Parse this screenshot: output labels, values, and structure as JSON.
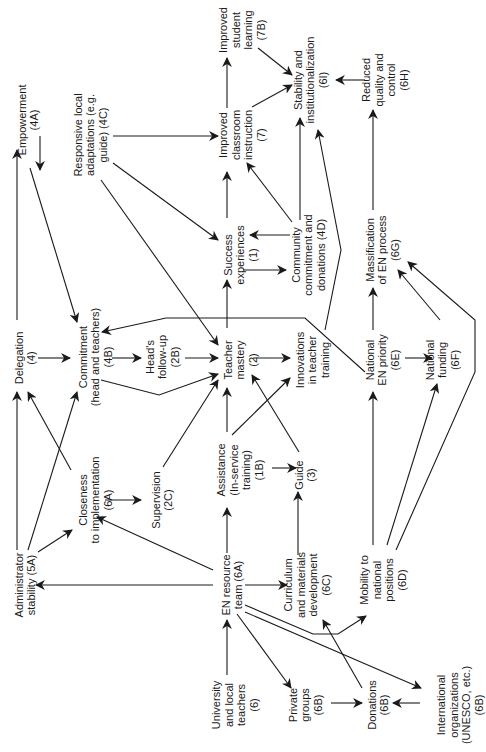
{
  "figure": {
    "orientation": "rotated-90-ccw",
    "line_color": "#1a1a1a",
    "background": "#ffffff"
  },
  "nodes": [
    {
      "id": "4A",
      "lines": [
        "Empowerment",
        "(4A)"
      ],
      "x": 28,
      "y": 120
    },
    {
      "id": "4C",
      "lines": [
        "Responsive local",
        "adaptations (e.g.",
        "guide) (4C)"
      ],
      "x": 90,
      "y": 135
    },
    {
      "id": "7B",
      "lines": [
        "Improved",
        "student",
        "learning",
        "(7B)"
      ],
      "x": 242,
      "y": 30
    },
    {
      "id": "7",
      "lines": [
        "Improved",
        "classroom",
        "instruction",
        "(7)"
      ],
      "x": 242,
      "y": 135
    },
    {
      "id": "6I",
      "lines": [
        "Stability and",
        "institutionalization",
        "(6I)"
      ],
      "x": 310,
      "y": 80
    },
    {
      "id": "6H",
      "lines": [
        "Reduced",
        "quality and",
        "control",
        "(6H)"
      ],
      "x": 385,
      "y": 80
    },
    {
      "id": "1",
      "lines": [
        "Success",
        "experiences",
        "(1)"
      ],
      "x": 240,
      "y": 255
    },
    {
      "id": "4D",
      "lines": [
        "Community",
        "commitment and",
        "donations (4D)"
      ],
      "x": 308,
      "y": 255
    },
    {
      "id": "4",
      "lines": [
        "Delegation",
        "(4)"
      ],
      "x": 25,
      "y": 358
    },
    {
      "id": "4B",
      "lines": [
        "Commitment",
        "(head and teachers)",
        "(4B)"
      ],
      "x": 95,
      "y": 357
    },
    {
      "id": "2B",
      "lines": [
        "Head's",
        "follow-up",
        "(2B)"
      ],
      "x": 162,
      "y": 357
    },
    {
      "id": "2",
      "lines": [
        "Teacher",
        "mastery",
        "(2)"
      ],
      "x": 240,
      "y": 360
    },
    {
      "id": "IT",
      "lines": [
        "Innovations",
        "in teacher",
        "training"
      ],
      "x": 312,
      "y": 360
    },
    {
      "id": "6E",
      "lines": [
        "National",
        "EN priority",
        "(6E)"
      ],
      "x": 382,
      "y": 360
    },
    {
      "id": "6F",
      "lines": [
        "National",
        "funding",
        "(6F)"
      ],
      "x": 442,
      "y": 360
    },
    {
      "id": "6G",
      "lines": [
        "Massification",
        "of EN process",
        "(6G)"
      ],
      "x": 382,
      "y": 250
    },
    {
      "id": "5A",
      "lines": [
        "Administrator",
        "stability (5A)"
      ],
      "x": 25,
      "y": 585
    },
    {
      "id": "6A-close",
      "lines": [
        "Closeness",
        "to implementation",
        "(6A)"
      ],
      "x": 95,
      "y": 500
    },
    {
      "id": "2C",
      "lines": [
        "Supervision",
        "(2C)"
      ],
      "x": 162,
      "y": 500
    },
    {
      "id": "1B",
      "lines": [
        "Assistance",
        "(In-service",
        "training)",
        "(1B)"
      ],
      "x": 240,
      "y": 470
    },
    {
      "id": "3",
      "lines": [
        "Guide",
        "(3)"
      ],
      "x": 305,
      "y": 475
    },
    {
      "id": "6A",
      "lines": [
        "EN resource",
        "team (6A)"
      ],
      "x": 232,
      "y": 585
    },
    {
      "id": "6C",
      "lines": [
        "Curriculum",
        "and materials",
        "development",
        "(6C)"
      ],
      "x": 307,
      "y": 585
    },
    {
      "id": "6D",
      "lines": [
        "Mobility to",
        "national",
        "positions",
        "(6D)"
      ],
      "x": 383,
      "y": 580
    },
    {
      "id": "6",
      "lines": [
        "University",
        "and local",
        "teachers",
        "(6)"
      ],
      "x": 235,
      "y": 705
    },
    {
      "id": "6B-private",
      "lines": [
        "Private",
        "groups",
        "(6B)"
      ],
      "x": 305,
      "y": 705
    },
    {
      "id": "6B-donations",
      "lines": [
        "Donations",
        "(6B)"
      ],
      "x": 378,
      "y": 705
    },
    {
      "id": "6B-intl",
      "lines": [
        "International",
        "organizations",
        "(UNESCO, etc.)",
        "(6B)"
      ],
      "x": 460,
      "y": 705
    }
  ],
  "edges": [
    {
      "from": "4",
      "to": "4A",
      "points": [
        [
          17,
          320
        ],
        [
          17,
          150
        ]
      ]
    },
    {
      "from": "4A",
      "to": "4C",
      "points": [
        [
          40,
          136
        ],
        [
          40,
          170
        ]
      ]
    },
    {
      "from": "4A",
      "to": "4B",
      "points": [
        [
          30,
          168
        ],
        [
          77,
          322
        ]
      ]
    },
    {
      "from": "4C",
      "to": "7",
      "points": [
        [
          113,
          136
        ],
        [
          218,
          136
        ]
      ]
    },
    {
      "from": "4C",
      "to": "1",
      "points": [
        [
          113,
          163
        ],
        [
          218,
          240
        ]
      ]
    },
    {
      "from": "4C",
      "to": "2",
      "points": [
        [
          101,
          180
        ],
        [
          218,
          345
        ]
      ]
    },
    {
      "from": "7",
      "to": "7B",
      "points": [
        [
          227,
          108
        ],
        [
          227,
          58
        ]
      ]
    },
    {
      "from": "7B",
      "to": "6I",
      "points": [
        [
          258,
          48
        ],
        [
          292,
          75
        ]
      ]
    },
    {
      "from": "7",
      "to": "6I",
      "points": [
        [
          252,
          107
        ],
        [
          292,
          85
        ]
      ]
    },
    {
      "from": "6H",
      "to": "6I",
      "points": [
        [
          365,
          80
        ],
        [
          336,
          80
        ]
      ]
    },
    {
      "from": "1",
      "to": "7",
      "points": [
        [
          227,
          218
        ],
        [
          227,
          172
        ]
      ]
    },
    {
      "from": "1",
      "to": "4D",
      "points": [
        [
          243,
          270
        ],
        [
          286,
          270
        ]
      ]
    },
    {
      "from": "4D",
      "to": "1",
      "points": [
        [
          290,
          235
        ],
        [
          250,
          235
        ]
      ]
    },
    {
      "from": "4D",
      "to": "7",
      "points": [
        [
          292,
          222
        ],
        [
          247,
          163
        ]
      ]
    },
    {
      "from": "4D",
      "to": "6I",
      "points": [
        [
          300,
          220
        ],
        [
          300,
          118
        ]
      ]
    },
    {
      "from": "IT",
      "to": "6I",
      "points": [
        [
          325,
          330
        ],
        [
          341,
          250
        ],
        [
          318,
          130
        ]
      ]
    },
    {
      "from": "6G",
      "to": "6H",
      "points": [
        [
          373,
          210
        ],
        [
          373,
          110
        ]
      ]
    },
    {
      "from": "6E",
      "to": "6G",
      "points": [
        [
          373,
          330
        ],
        [
          373,
          288
        ]
      ]
    },
    {
      "from": "6F",
      "to": "6G",
      "points": [
        [
          440,
          320
        ],
        [
          398,
          270
        ]
      ]
    },
    {
      "from": "6D",
      "to": "6G",
      "points": [
        [
          396,
          550
        ],
        [
          475,
          372
        ],
        [
          475,
          320
        ],
        [
          408,
          262
        ]
      ]
    },
    {
      "from": "4",
      "to": "4B",
      "points": [
        [
          38,
          358
        ],
        [
          70,
          358
        ]
      ]
    },
    {
      "from": "6E",
      "to": "4B",
      "points": [
        [
          365,
          372
        ],
        [
          305,
          318
        ],
        [
          240,
          318
        ],
        [
          166,
          318
        ],
        [
          102,
          332
        ]
      ]
    },
    {
      "from": "4B",
      "to": "2B",
      "points": [
        [
          112,
          358
        ],
        [
          141,
          358
        ]
      ]
    },
    {
      "from": "2B",
      "to": "2",
      "points": [
        [
          185,
          358
        ],
        [
          218,
          358
        ]
      ]
    },
    {
      "from": "4B",
      "to": "2",
      "points": [
        [
          101,
          380
        ],
        [
          159,
          395
        ],
        [
          218,
          374
        ]
      ]
    },
    {
      "from": "2",
      "to": "1",
      "points": [
        [
          227,
          328
        ],
        [
          227,
          280
        ]
      ]
    },
    {
      "from": "2",
      "to": "IT",
      "points": [
        [
          253,
          358
        ],
        [
          290,
          358
        ]
      ]
    },
    {
      "from": "6E",
      "to": "6F",
      "points": [
        [
          405,
          358
        ],
        [
          432,
          358
        ]
      ]
    },
    {
      "from": "5A",
      "to": "4",
      "points": [
        [
          17,
          550
        ],
        [
          17,
          392
        ]
      ]
    },
    {
      "from": "6A-close",
      "to": "4",
      "points": [
        [
          71,
          470
        ],
        [
          28,
          392
        ]
      ]
    },
    {
      "from": "5A",
      "to": "4B",
      "points": [
        [
          28,
          550
        ],
        [
          77,
          392
        ]
      ]
    },
    {
      "from": "5A",
      "to": "6A-close",
      "points": [
        [
          38,
          552
        ],
        [
          72,
          530
        ]
      ]
    },
    {
      "from": "6A-close",
      "to": "2C",
      "points": [
        [
          105,
          500
        ],
        [
          141,
          500
        ]
      ]
    },
    {
      "from": "2C",
      "to": "2",
      "points": [
        [
          163,
          467
        ],
        [
          218,
          380
        ]
      ]
    },
    {
      "from": "1B",
      "to": "2",
      "points": [
        [
          227,
          432
        ],
        [
          227,
          388
        ]
      ]
    },
    {
      "from": "1B",
      "to": "IT",
      "points": [
        [
          232,
          435
        ],
        [
          290,
          378
        ]
      ]
    },
    {
      "from": "3",
      "to": "2",
      "points": [
        [
          299,
          452
        ],
        [
          252,
          375
        ]
      ]
    },
    {
      "from": "1B",
      "to": "3",
      "points": [
        [
          272,
          468
        ],
        [
          296,
          468
        ]
      ]
    },
    {
      "from": "6C",
      "to": "3",
      "points": [
        [
          298,
          555
        ],
        [
          298,
          492
        ]
      ]
    },
    {
      "from": "6D",
      "to": "6E",
      "points": [
        [
          373,
          545
        ],
        [
          373,
          392
        ]
      ]
    },
    {
      "from": "6D",
      "to": "6F",
      "points": [
        [
          387,
          545
        ],
        [
          437,
          384
        ]
      ]
    },
    {
      "from": "6A",
      "to": "1B",
      "points": [
        [
          227,
          553
        ],
        [
          227,
          508
        ]
      ]
    },
    {
      "from": "6A",
      "to": "6A-close",
      "points": [
        [
          213,
          570
        ],
        [
          97,
          517
        ]
      ]
    },
    {
      "from": "6A",
      "to": "5A",
      "points": [
        [
          213,
          585
        ],
        [
          36,
          585
        ]
      ]
    },
    {
      "from": "6A",
      "to": "6C",
      "points": [
        [
          245,
          585
        ],
        [
          287,
          585
        ]
      ]
    },
    {
      "from": "6",
      "to": "6A",
      "points": [
        [
          227,
          675
        ],
        [
          227,
          620
        ]
      ]
    },
    {
      "from": "6A",
      "to": "6D",
      "points": [
        [
          245,
          605
        ],
        [
          313,
          634
        ],
        [
          338,
          634
        ],
        [
          366,
          616
        ]
      ]
    },
    {
      "from": "6A",
      "to": "6B-intl",
      "points": [
        [
          245,
          612
        ],
        [
          421,
          688
        ]
      ]
    },
    {
      "from": "6A",
      "to": "6B-private",
      "points": [
        [
          237,
          614
        ],
        [
          291,
          688
        ]
      ]
    },
    {
      "from": "6B-private",
      "to": "6B-donations",
      "points": [
        [
          331,
          703
        ],
        [
          362,
          703
        ]
      ]
    },
    {
      "from": "6B-intl",
      "to": "6B-donations",
      "points": [
        [
          420,
          703
        ],
        [
          393,
          703
        ]
      ]
    },
    {
      "from": "6B-donations",
      "to": "6C",
      "points": [
        [
          362,
          688
        ],
        [
          323,
          620
        ]
      ]
    }
  ]
}
